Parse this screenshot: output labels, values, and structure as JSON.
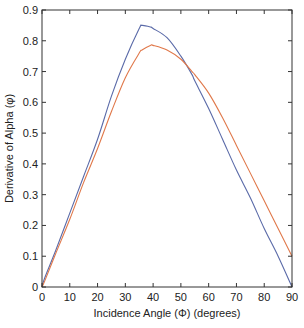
{
  "chart_data": {
    "type": "line",
    "title": "",
    "xlabel": "Incidence Angle (Φ)  (degrees)",
    "ylabel": "Derivative of Alpha (φ)",
    "xlim": [
      0,
      90
    ],
    "ylim": [
      0,
      0.9
    ],
    "xticks": [
      0,
      10,
      20,
      30,
      40,
      50,
      60,
      70,
      80,
      90
    ],
    "yticks": [
      0,
      0.1,
      0.2,
      0.3,
      0.4,
      0.5,
      0.6,
      0.7,
      0.8,
      0.9
    ],
    "xtick_labels": [
      "0",
      "10",
      "20",
      "30",
      "40",
      "50",
      "60",
      "70",
      "80",
      "90"
    ],
    "ytick_labels": [
      "0",
      "0.1",
      "0.2",
      "0.3",
      "0.4",
      "0.5",
      "0.6",
      "0.7",
      "0.8",
      "0.9"
    ],
    "grid": false,
    "legend": null,
    "x": [
      0,
      1,
      5,
      10,
      15,
      20,
      25,
      30,
      35,
      36,
      39,
      40,
      45,
      50,
      54,
      55,
      60,
      65,
      70,
      75,
      80,
      85,
      90
    ],
    "series": [
      {
        "name": "blue curve",
        "color": "#5a6aa8",
        "values": [
          0.0,
          0.03,
          0.12,
          0.24,
          0.36,
          0.48,
          0.62,
          0.74,
          0.84,
          0.85,
          0.845,
          0.84,
          0.81,
          0.75,
          0.69,
          0.67,
          0.58,
          0.48,
          0.38,
          0.29,
          0.19,
          0.1,
          0.0
        ]
      },
      {
        "name": "orange curve",
        "color": "#e0784a",
        "values": [
          0.0,
          0.02,
          0.11,
          0.22,
          0.34,
          0.45,
          0.57,
          0.68,
          0.76,
          0.77,
          0.785,
          0.785,
          0.77,
          0.74,
          0.7,
          0.69,
          0.63,
          0.55,
          0.46,
          0.37,
          0.28,
          0.19,
          0.1
        ]
      }
    ],
    "annotations": []
  }
}
